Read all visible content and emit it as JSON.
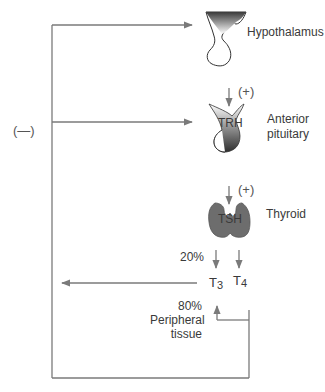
{
  "diagram": {
    "organs": {
      "hypothalamus": {
        "label": "Hypothalamus",
        "icon": "hypothalamus-icon"
      },
      "anterior_pituitary": {
        "label_line1": "Anterior",
        "label_line2": "pituitary",
        "icon": "pituitary-icon"
      },
      "thyroid": {
        "label": "Thyroid",
        "icon": "thyroid-icon"
      },
      "peripheral_tissue": {
        "label_line1": "Peripheral",
        "label_line2": "tissue"
      }
    },
    "hormones": {
      "trh": "TRH",
      "tsh": "TSH",
      "t3_base": "T",
      "t3_sub": "3",
      "t4_base": "T",
      "t4_sub": "4"
    },
    "stimulation": {
      "hypothalamus_to_trh": "(+)",
      "pituitary_to_tsh": "(+)"
    },
    "negative_feedback": "(—)",
    "percentages": {
      "thyroid_t3": "20%",
      "peripheral_t3": "80%"
    },
    "colors": {
      "line": "#7a7a7a",
      "text": "#3a3a3a",
      "organ_fill": "#6d6d6d",
      "organ_outline": "#444444"
    }
  }
}
